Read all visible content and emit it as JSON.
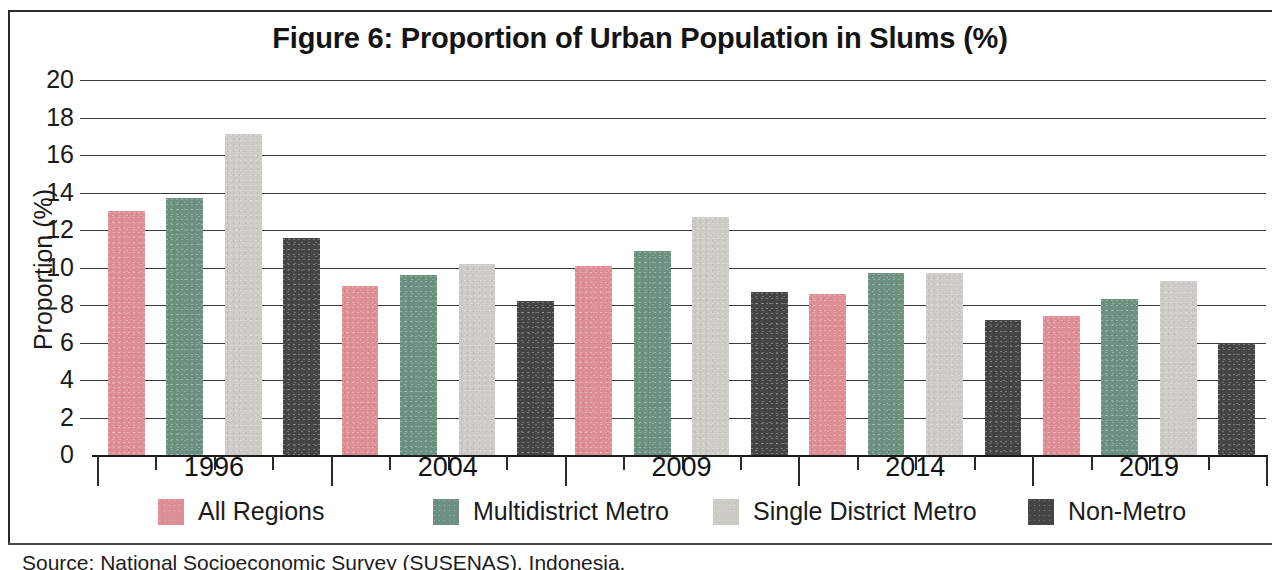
{
  "figure": {
    "title": "Figure 6:  Proportion of Urban Population in Slums (%)",
    "source_text": "Source:  National Socioeconomic Survey (SUSENAS), Indonesia."
  },
  "chart_data": {
    "type": "bar",
    "title": "Figure 6:  Proportion of Urban Population in Slums (%)",
    "xlabel": "",
    "ylabel": "Proportion (%)",
    "ylim": [
      0,
      20
    ],
    "ytick_step": 2,
    "yticks": [
      20,
      18,
      16,
      14,
      12,
      10,
      8,
      6,
      4,
      2,
      0
    ],
    "ytick_labels": [
      "20",
      "18",
      "16",
      "14",
      "12",
      "10",
      "8",
      "6",
      "4",
      "2",
      "0"
    ],
    "grid": true,
    "legend_position": "bottom",
    "categories": [
      "1996",
      "2004",
      "2009",
      "2014",
      "2019"
    ],
    "series": [
      {
        "name": "All Regions",
        "color": "#dd8f95",
        "values": [
          13.0,
          9.0,
          10.1,
          8.6,
          7.4
        ]
      },
      {
        "name": "Multidistrict Metro",
        "color": "#6d9180",
        "values": [
          13.7,
          9.6,
          10.9,
          9.7,
          8.3
        ]
      },
      {
        "name": "Single District Metro",
        "color": "#cdcbc6",
        "values": [
          17.1,
          10.2,
          12.7,
          9.7,
          9.3
        ]
      },
      {
        "name": "Non-Metro",
        "color": "#454545",
        "values": [
          11.6,
          8.2,
          8.7,
          7.2,
          6.0
        ]
      }
    ]
  }
}
